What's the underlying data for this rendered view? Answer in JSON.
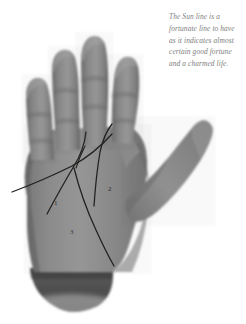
{
  "page": {
    "width": 246,
    "height": 324,
    "background_color": "#ffffff",
    "kind": "palmistry-illustration"
  },
  "caption": {
    "name": "sun-line-caption",
    "full_text": "The Sun line is a fortunate line to have as it indicates almost certain good fortune and a charmed life.",
    "lines": [
      "The Sun line is a",
      "fortunate line to have",
      "as it indicates almost",
      "certain good fortune",
      "and a charmed life."
    ],
    "text_color": "#7d7d7d",
    "style": "italic"
  },
  "illustration": {
    "subject": "open-right-palm-photograph",
    "alt_text": "Grayscale photograph of an open hand, palm facing the viewer, fingers pointing up and thumb extended to the right, with palm lines drawn over it",
    "palette": {
      "skin_mid": "#8d8d8d",
      "skin_light": "#a5a5a5",
      "skin_dark": "#6f6f6f",
      "cuff_dark": "#4a4a4a",
      "line_color": "#20201f",
      "background": "#ffffff"
    },
    "parts": [
      {
        "name": "index-finger",
        "label": ""
      },
      {
        "name": "middle-finger",
        "label": ""
      },
      {
        "name": "ring-finger",
        "label": ""
      },
      {
        "name": "little-finger",
        "label": ""
      },
      {
        "name": "thumb",
        "label": ""
      },
      {
        "name": "palm",
        "label": ""
      },
      {
        "name": "wrist-cuff",
        "label": ""
      }
    ],
    "palm_lines": [
      {
        "name": "head-line",
        "label": ""
      },
      {
        "name": "heart-line",
        "label": ""
      },
      {
        "name": "life-line",
        "label": ""
      },
      {
        "name": "sun-line",
        "label": ""
      },
      {
        "name": "fate-line",
        "label": ""
      }
    ],
    "markers": [
      {
        "name": "marker-1",
        "label": "1"
      },
      {
        "name": "marker-2",
        "label": "2"
      },
      {
        "name": "marker-3",
        "label": "3"
      }
    ]
  }
}
